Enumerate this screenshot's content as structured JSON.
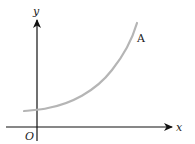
{
  "diagram": {
    "type": "function-graph",
    "axes": {
      "x_label": "x",
      "y_label": "y",
      "origin_label": "O"
    },
    "curve": {
      "label": "A",
      "shape": "exponential growth",
      "color": "#b5b5b5"
    },
    "colors": {
      "axis": "#111111",
      "text": "#222222",
      "background": "#ffffff"
    }
  }
}
